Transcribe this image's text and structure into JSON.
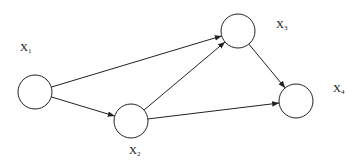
{
  "diagram": {
    "type": "directed-graph",
    "nodes": [
      {
        "id": "X1",
        "label": "X",
        "sub": "1",
        "cx": 35,
        "cy": 92,
        "r": 17,
        "lx": 20,
        "ly": 41
      },
      {
        "id": "X2",
        "label": "X",
        "sub": "2",
        "cx": 131,
        "cy": 121,
        "r": 17,
        "lx": 129,
        "ly": 144
      },
      {
        "id": "X3",
        "label": "X",
        "sub": "3",
        "cx": 238,
        "cy": 31,
        "r": 17,
        "lx": 276,
        "ly": 18
      },
      {
        "id": "X4",
        "label": "X",
        "sub": "4",
        "cx": 296,
        "cy": 101,
        "r": 17,
        "lx": 333,
        "ly": 82
      }
    ],
    "edges": [
      {
        "from": "X1",
        "to": "X2"
      },
      {
        "from": "X1",
        "to": "X3"
      },
      {
        "from": "X2",
        "to": "X3"
      },
      {
        "from": "X2",
        "to": "X4"
      },
      {
        "from": "X3",
        "to": "X4"
      }
    ],
    "colors": {
      "stroke": "#222222",
      "fill": "#ffffff"
    }
  }
}
